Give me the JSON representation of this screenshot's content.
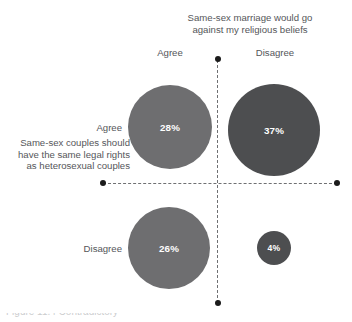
{
  "chart_data": {
    "type": "scatter",
    "title": "",
    "xlabel": "Same-sex marriage would go against my religious beliefs",
    "ylabel": "Same-sex couples should have the same legal rights as heterosexual couples",
    "x_categories": [
      "Agree",
      "Disagree"
    ],
    "y_categories": [
      "Agree",
      "Disagree"
    ],
    "grid": false,
    "legend": "none",
    "axis_style": "dashed crosshair with endpoint dots",
    "points": [
      {
        "x_category": "Agree",
        "y_category": "Agree",
        "value": 28,
        "label": "28%",
        "color": "#6e6e70",
        "radius_px": 42,
        "center_px": [
          170,
          127
        ]
      },
      {
        "x_category": "Disagree",
        "y_category": "Agree",
        "value": 37,
        "label": "37%",
        "color": "#4d4e50",
        "radius_px": 46,
        "center_px": [
          274,
          130
        ]
      },
      {
        "x_category": "Agree",
        "y_category": "Disagree",
        "value": 26,
        "label": "26%",
        "color": "#6e6e70",
        "radius_px": 41,
        "center_px": [
          169,
          248
        ]
      },
      {
        "x_category": "Disagree",
        "y_category": "Disagree",
        "value": 4,
        "label": "4%",
        "color": "#4d4e50",
        "radius_px": 17,
        "center_px": [
          274,
          248
        ]
      }
    ]
  },
  "labels": {
    "column_axis_title_line1": "Same-sex marriage would go",
    "column_axis_title_line2": "against my religious beliefs",
    "column_agree": "Agree",
    "column_disagree": "Disagree",
    "row_axis_title": "Same-sex couples should have the same legal rights as heterosexual couples",
    "row_agree": "Agree",
    "row_disagree": "Disagree"
  },
  "bubbles": {
    "top_left": "28%",
    "top_right": "37%",
    "bottom_left": "26%",
    "bottom_right": "4%"
  },
  "caption_fragment": "Figure 11.4 Contradictory",
  "colors": {
    "bubble_light": "#6e6e70",
    "bubble_dark": "#4d4e50",
    "text": "#55565a",
    "axis": "#6f7072",
    "dot": "#1b1b1b",
    "bubble_text": "#ffffff"
  }
}
